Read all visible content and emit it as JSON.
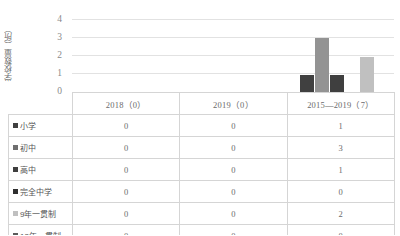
{
  "chart_data": {
    "type": "bar",
    "title": "",
    "xlabel": "",
    "ylabel": "学校数量（所）",
    "ylim": [
      0,
      4
    ],
    "yticks": [
      "0",
      "1",
      "2",
      "3",
      "4"
    ],
    "grid": true,
    "legend_position": "table-rows",
    "categories": [
      "2018（0）",
      "2019（0）",
      "2015—2019（7）"
    ],
    "series": [
      {
        "name": "小学",
        "color": "#404040",
        "values": [
          0,
          0,
          1
        ]
      },
      {
        "name": "初中",
        "color": "#939393",
        "values": [
          0,
          0,
          3
        ]
      },
      {
        "name": "高中",
        "color": "#3f3f3f",
        "values": [
          0,
          0,
          1
        ]
      },
      {
        "name": "完全中学",
        "color": "#2f2f2f",
        "values": [
          0,
          0,
          0
        ]
      },
      {
        "name": "9年一贯制",
        "color": "#c0c0c0",
        "values": [
          0,
          0,
          2
        ]
      },
      {
        "name": "12年一贯制",
        "color": "#5a5a5a",
        "values": [
          0,
          0,
          0
        ]
      }
    ]
  },
  "table": {
    "corner_label": "",
    "columns": [
      "2018（0）",
      "2019（0）",
      "2015—2019（7）"
    ],
    "rows": [
      {
        "label": "小学",
        "marker_color": "#404040",
        "values": [
          "0",
          "0",
          "1"
        ]
      },
      {
        "label": "初中",
        "marker_color": "#6f6f6f",
        "values": [
          "0",
          "0",
          "3"
        ]
      },
      {
        "label": "高中",
        "marker_color": "#3f3f3f",
        "values": [
          "0",
          "0",
          "1"
        ]
      },
      {
        "label": "完全中学",
        "marker_color": "#2f2f2f",
        "values": [
          "0",
          "0",
          "0"
        ]
      },
      {
        "label": "9年一贯制",
        "marker_color": "#c0c0c0",
        "values": [
          "0",
          "0",
          "2"
        ]
      },
      {
        "label": "12年一贯制",
        "marker_color": "#5a5a5a",
        "values": [
          "0",
          "0",
          "0"
        ]
      }
    ]
  },
  "axis": {
    "tick_4": "4",
    "tick_3": "3",
    "tick_2": "2",
    "tick_1": "1",
    "tick_0": "0"
  }
}
